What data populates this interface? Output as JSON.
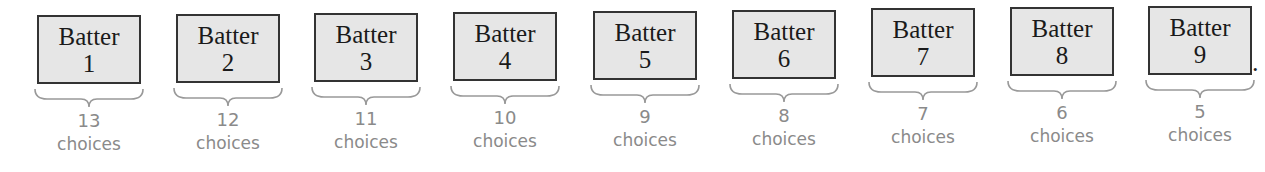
{
  "figure": {
    "batters": [
      {
        "label": "Batter",
        "number": "1",
        "choices": "13",
        "unit": "choices"
      },
      {
        "label": "Batter",
        "number": "2",
        "choices": "12",
        "unit": "choices"
      },
      {
        "label": "Batter",
        "number": "3",
        "choices": "11",
        "unit": "choices"
      },
      {
        "label": "Batter",
        "number": "4",
        "choices": "10",
        "unit": "choices"
      },
      {
        "label": "Batter",
        "number": "5",
        "choices": "9",
        "unit": "choices"
      },
      {
        "label": "Batter",
        "number": "6",
        "choices": "8",
        "unit": "choices"
      },
      {
        "label": "Batter",
        "number": "7",
        "choices": "7",
        "unit": "choices"
      },
      {
        "label": "Batter",
        "number": "8",
        "choices": "6",
        "unit": "choices"
      },
      {
        "label": "Batter",
        "number": "9",
        "choices": "5",
        "unit": "choices"
      }
    ],
    "trailing_punctuation": ".",
    "colors": {
      "box_fill": "#e6e6e6",
      "box_border": "#333333",
      "annotation": "#8a8a8a"
    }
  }
}
